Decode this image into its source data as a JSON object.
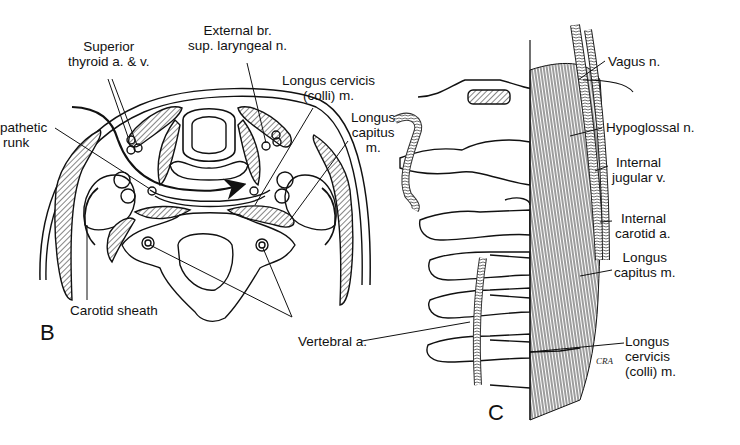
{
  "figure": {
    "panels": [
      {
        "id": "B",
        "label": "B",
        "view": "axial cross-section of neck"
      },
      {
        "id": "C",
        "label": "C",
        "view": "lateral view of cervical spine"
      }
    ]
  },
  "panel_b": {
    "labels": {
      "superior_thyroid": [
        "Superior",
        "thyroid a. & v."
      ],
      "external_branch": [
        "External br.",
        "sup. laryngeal n."
      ],
      "longus_cervicis": [
        "Longus cervicis",
        "(colli) m."
      ],
      "longus_capitus": [
        "Longus",
        "capitus",
        "m."
      ],
      "sympathetic_trunk": [
        "pathetic",
        "runk"
      ],
      "carotid_sheath": "Carotid sheath",
      "vertebral_artery": "Vertebral a."
    }
  },
  "panel_c": {
    "labels": {
      "vagus": "Vagus n.",
      "hypoglossal": "Hypoglossal n.",
      "internal_jugular": [
        "Internal",
        "jugular v."
      ],
      "internal_carotid": [
        "Internal",
        "carotid a."
      ],
      "longus_capitus": [
        "Longus",
        "capitus m."
      ],
      "longus_cervicis": [
        "Longus",
        "cervicis",
        "(colli) m."
      ]
    },
    "signature": "CRA"
  },
  "colors": {
    "ink": "#111111",
    "background": "#ffffff",
    "hatch": "#444444"
  }
}
